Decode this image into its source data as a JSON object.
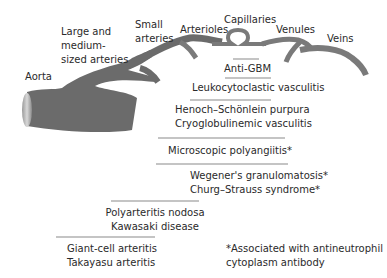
{
  "vessel_labels": {
    "aorta": "Aorta",
    "large_medium_1": "Large and",
    "large_medium_2": "medium-",
    "large_medium_3": "sized arteries",
    "small_arteries_1": "Small",
    "small_arteries_2": "arteries",
    "arterioles": "Arterioles",
    "capillaries": "Capillaries",
    "venules": "Venules",
    "veins": "Veins"
  },
  "diseases": {
    "anti_gbm": "Anti-GBM",
    "leukocytoclastic": "Leukocytoclastic vasculitis",
    "henoch": "Henoch–Schönlein purpura",
    "cryoglobulinemic": "Cryoglobulinemic vasculitis",
    "microscopic": "Microscopic polyangiitis*",
    "wegener": "Wegener's granulomatosis*",
    "churg": "Churg–Strauss syndrome*",
    "polyarteritis": "Polyarteritis nodosa",
    "kawasaki": "Kawasaki disease",
    "giant_cell": "Giant-cell arteritis",
    "takayasu": "Takayasu arteritis"
  },
  "footnote": {
    "line1": "*Associated with antineutrophil",
    "line2": "cytoplasm antibody"
  },
  "colors": {
    "vessel": "#6b6b6b",
    "bar": "#c4c4c4",
    "text": "#2a2a2a"
  }
}
